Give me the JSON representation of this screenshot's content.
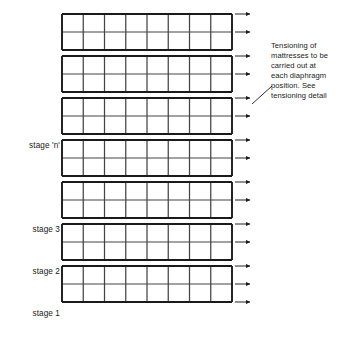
{
  "diagram": {
    "type": "engineering-cross-section",
    "colors": {
      "line": "#1a1a1a",
      "grid_minor": "#444444",
      "background": "#ffffff",
      "text": "#1a1a1a"
    },
    "geometry": {
      "panel_count": 7,
      "columns_per_panel": 8,
      "rows_per_panel": 2,
      "grid_left_x": 62,
      "grid_right_x": 232,
      "arrow_tip_x": 250,
      "panel_top_ys": [
        14,
        56,
        98,
        140,
        182,
        224,
        266
      ],
      "panel_height": 36,
      "panel_pitch": 42,
      "arrows_per_panel": 2
    },
    "stage_labels": [
      {
        "id": "stage-n",
        "text": "stage 'n'",
        "y": 141,
        "right_x": 60
      },
      {
        "id": "stage-3",
        "text": "stage 3",
        "y": 225,
        "right_x": 60
      },
      {
        "id": "stage-2",
        "text": "stage 2",
        "y": 267,
        "right_x": 60
      },
      {
        "id": "stage-1",
        "text": "stage 1",
        "y": 309,
        "right_x": 60
      }
    ],
    "annotation": {
      "id": "tensioning-note",
      "lines": [
        "Tensioning of",
        "mattresses to be",
        "carried out at",
        "each diaphragm",
        "position. See",
        "tensioning detail"
      ],
      "full_text": "Tensioning of mattresses to be carried out at each diaphragm position. See tensioning detail",
      "leader_line": {
        "x1": 272,
        "y1": 86,
        "x2": 252,
        "y2": 104
      },
      "points_to_arrow_index": 5
    },
    "arrow_rows": [
      {
        "index": 0,
        "y": 14
      },
      {
        "index": 1,
        "y": 32
      },
      {
        "index": 2,
        "y": 56
      },
      {
        "index": 3,
        "y": 74
      },
      {
        "index": 4,
        "y": 98
      },
      {
        "index": 5,
        "y": 104
      },
      {
        "index": 6,
        "y": 116
      },
      {
        "index": 7,
        "y": 140
      },
      {
        "index": 8,
        "y": 158
      },
      {
        "index": 9,
        "y": 182
      },
      {
        "index": 10,
        "y": 200
      },
      {
        "index": 11,
        "y": 224
      },
      {
        "index": 12,
        "y": 242
      },
      {
        "index": 13,
        "y": 266
      },
      {
        "index": 14,
        "y": 284
      },
      {
        "index": 15,
        "y": 308
      },
      {
        "index": 16,
        "y": 326
      }
    ]
  }
}
